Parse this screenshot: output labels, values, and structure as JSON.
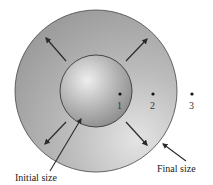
{
  "diagram": {
    "title": "",
    "labels": {
      "initial_size": "Initial size",
      "final_size": "Final size"
    },
    "points": [
      {
        "label": "1",
        "x": 120,
        "y": 94
      },
      {
        "label": "2",
        "x": 153,
        "y": 94
      },
      {
        "label": "3",
        "x": 192,
        "y": 94
      }
    ],
    "colors": {
      "outer_circle_fill": "#a9a9a9",
      "outer_circle_light": "#e2e2e2",
      "inner_sphere_highlight": "#e6e6e6",
      "inner_sphere_shadow": "#8a8a8a",
      "stroke": "#333333",
      "background": "#ffffff"
    }
  }
}
